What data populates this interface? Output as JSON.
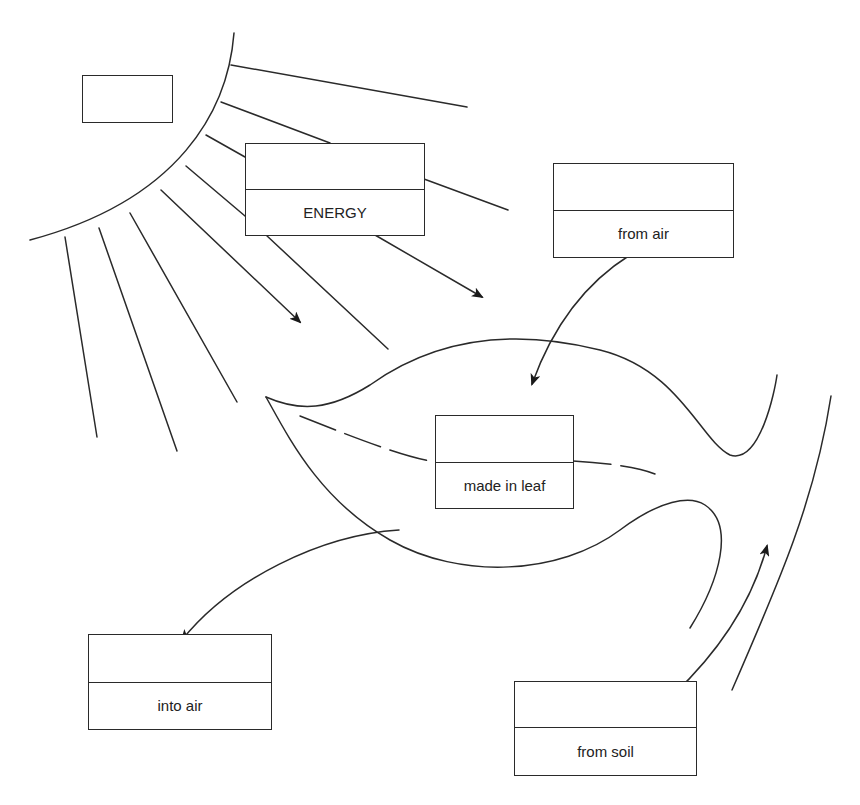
{
  "diagram": {
    "title_fragment": "",
    "sun": {
      "label_box": {
        "blank": true
      }
    },
    "boxes": [
      {
        "id": "energy",
        "top_blank": true,
        "label": "ENERGY"
      },
      {
        "id": "from-air",
        "top_blank": true,
        "label": "from air"
      },
      {
        "id": "made-in-leaf",
        "top_blank": true,
        "label": "made in leaf"
      },
      {
        "id": "into-air",
        "top_blank": true,
        "label": "into air"
      },
      {
        "id": "from-soil",
        "top_blank": true,
        "label": "from soil"
      }
    ],
    "colors": {
      "ink": "#2a2a2a",
      "background": "#ffffff"
    }
  }
}
